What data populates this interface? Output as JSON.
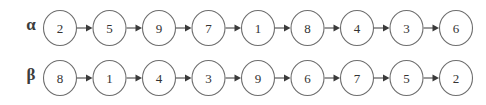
{
  "diagram": {
    "type": "sequence-chain-diagram",
    "background_color": "#ffffff",
    "node_stroke_color": "#6e6e6e",
    "node_fill_color": "#ffffff",
    "edge_color": "#5a5a5a",
    "text_color": "#333333",
    "label_color": "#3c3c3c",
    "edge_direction": "left-to-right",
    "rows": [
      {
        "label": "α",
        "label_name": "alpha",
        "nodes": [
          "2",
          "5",
          "9",
          "7",
          "1",
          "8",
          "4",
          "3",
          "6"
        ]
      },
      {
        "label": "β",
        "label_name": "beta",
        "nodes": [
          "8",
          "1",
          "4",
          "3",
          "9",
          "6",
          "7",
          "5",
          "2"
        ]
      }
    ]
  },
  "layout": {
    "first_center_x": 60,
    "pitch_x": 49.5,
    "center_y": 25,
    "radius_x": 16.5,
    "radius_y": 17.5
  }
}
